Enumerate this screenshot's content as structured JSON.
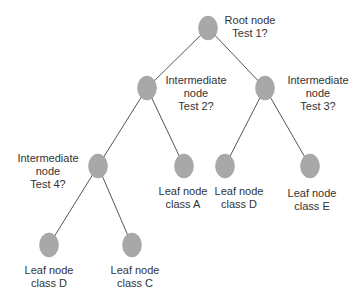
{
  "diagram": {
    "type": "decision-tree",
    "node_color": "#a8a8a8",
    "edge_color": "#555555",
    "nodes": [
      {
        "id": "root",
        "line1": "Root node",
        "line2": "Test 1?",
        "x": 208,
        "y": 28,
        "lx": 250,
        "ly": 14
      },
      {
        "id": "int2",
        "line1": "Intermediate",
        "line2": "node",
        "line3": "Test 2?",
        "x": 147,
        "y": 88,
        "lx": 196,
        "ly": 74
      },
      {
        "id": "int3",
        "line1": "Intermediate",
        "line2": "node",
        "line3": "Test 3?",
        "x": 265,
        "y": 88,
        "lx": 318,
        "ly": 74
      },
      {
        "id": "int4",
        "line1": "Intermediate",
        "line2": "node",
        "line3": "Test 4?",
        "x": 98,
        "y": 166,
        "lx": 48,
        "ly": 152
      },
      {
        "id": "leafA",
        "line1": "Leaf node",
        "line2": "class A",
        "x": 184,
        "y": 166,
        "lx": 183,
        "ly": 185
      },
      {
        "id": "leafD1",
        "line1": "Leaf node",
        "line2": "class D",
        "x": 225,
        "y": 166,
        "lx": 239,
        "ly": 185
      },
      {
        "id": "leafE",
        "line1": "Leaf node",
        "line2": "class E",
        "x": 310,
        "y": 166,
        "lx": 312,
        "ly": 187
      },
      {
        "id": "leafD2",
        "line1": "Leaf node",
        "line2": "class D",
        "x": 49,
        "y": 245,
        "lx": 49,
        "ly": 264
      },
      {
        "id": "leafC",
        "line1": "Leaf node",
        "line2": "class C",
        "x": 132,
        "y": 245,
        "lx": 135,
        "ly": 264
      }
    ],
    "edges": [
      [
        "root",
        "int2"
      ],
      [
        "root",
        "int3"
      ],
      [
        "int2",
        "int4"
      ],
      [
        "int2",
        "leafA"
      ],
      [
        "int3",
        "leafD1"
      ],
      [
        "int3",
        "leafE"
      ],
      [
        "int4",
        "leafD2"
      ],
      [
        "int4",
        "leafC"
      ]
    ]
  }
}
